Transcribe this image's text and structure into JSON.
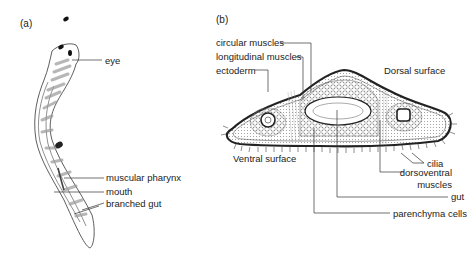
{
  "panels": [
    {
      "id": "a",
      "label": "(a)",
      "title": "Whole flatworm (planarian)",
      "labels": [
        "eye",
        "muscular pharynx",
        "mouth",
        "branched gut"
      ]
    },
    {
      "id": "b",
      "label": "(b)",
      "title": "Transverse section",
      "labels": [
        "circular muscles",
        "longitudinal muscles",
        "ectoderm",
        "Dorsal surface",
        "Ventral surface",
        "cilia",
        "dorsoventral muscles",
        "gut",
        "parenchyma cells"
      ]
    }
  ],
  "a": {
    "panel": "(a)",
    "eye": "eye",
    "pharynx": "muscular pharynx",
    "mouth": "mouth",
    "gut": "branched gut"
  },
  "b": {
    "panel": "(b)",
    "circular": "circular muscles",
    "longitudinal": "longitudinal muscles",
    "ectoderm": "ectoderm",
    "dorsal": "Dorsal surface",
    "ventral": "Ventral surface",
    "cilia": "cilia",
    "dv1": "dorsoventral",
    "dv2": "muscles",
    "gut": "gut",
    "parenchyma": "parenchyma cells"
  }
}
